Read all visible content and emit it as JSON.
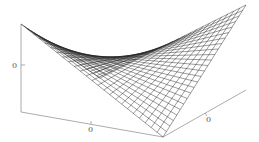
{
  "chart_data": {
    "type": "surface-wireframe",
    "title": "",
    "function": "z = x*y",
    "grid_lines": 24,
    "x_range": [
      -1,
      1
    ],
    "y_range": [
      -1,
      1
    ],
    "axes": {
      "x_ticks": [
        "0"
      ],
      "y_ticks": [
        "0"
      ],
      "z_ticks": [
        "0"
      ]
    },
    "colors": {
      "line": "#222222",
      "axis": "#777777",
      "background": "#ffffff"
    }
  }
}
